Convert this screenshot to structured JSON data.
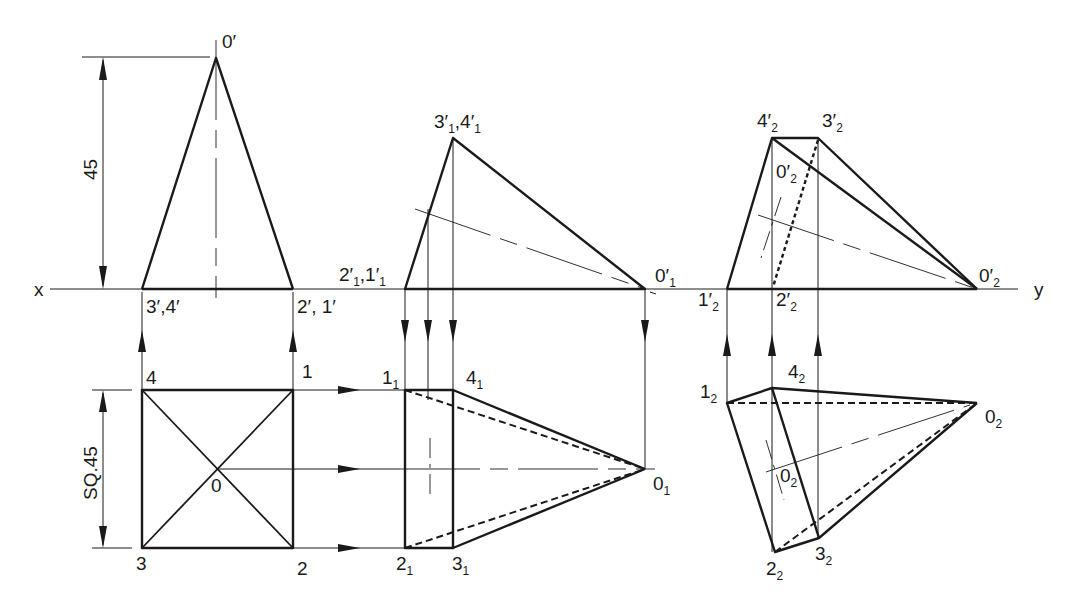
{
  "diagram": {
    "reference_line": {
      "left_label": "x",
      "right_label": "y"
    },
    "dimensions": {
      "height": "45",
      "base": "SQ.45"
    },
    "view1": {
      "front": {
        "apex": "0′",
        "left_base": "3′,4′",
        "right_base": "2′, 1′"
      },
      "top": {
        "p4": "4",
        "p1": "1",
        "p3": "3",
        "p2": "2",
        "center": "0"
      }
    },
    "view2": {
      "front": {
        "base_left_main": "2′",
        "base_left_sub1": "1",
        "base_left_mid": ",1′",
        "base_left_sub2": "1",
        "top_main": "3′",
        "top_sub1": "1",
        "top_mid": ",4′",
        "top_sub2": "1",
        "apex_main": "0′",
        "apex_sub": "1"
      },
      "top": {
        "p1_main": "1",
        "p1_sub": "1",
        "p4_main": "4",
        "p4_sub": "1",
        "p2_main": "2",
        "p2_sub": "1",
        "p3_main": "3",
        "p3_sub": "1",
        "apex_main": "0",
        "apex_sub": "1"
      }
    },
    "view3": {
      "front": {
        "p4_main": "4′",
        "p4_sub": "2",
        "p3_main": "3′",
        "p3_sub": "2",
        "center_main": "0′",
        "center_sub": "2",
        "p1_main": "1′",
        "p1_sub": "2",
        "p2_main": "2′",
        "p2_sub": "2",
        "apex_main": "0′",
        "apex_sub": "2"
      },
      "top": {
        "p1_main": "1",
        "p1_sub": "2",
        "p4_main": "4",
        "p4_sub": "2",
        "apex_main": "0",
        "apex_sub": "2",
        "center_main": "0",
        "center_sub": "2",
        "p2_main": "2",
        "p2_sub": "2",
        "p3_main": "3",
        "p3_sub": "2"
      }
    }
  }
}
